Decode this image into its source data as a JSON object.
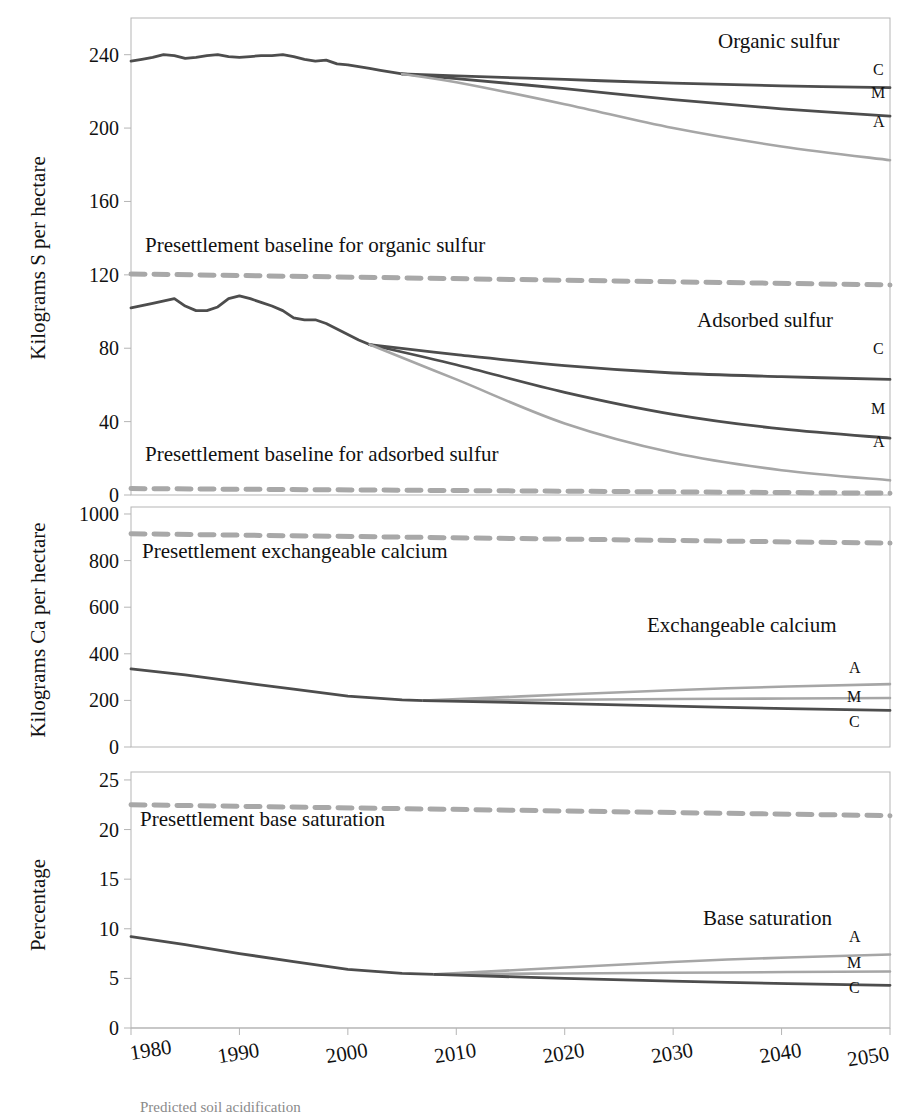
{
  "figure": {
    "caption_partial": "Predicted soil acidification"
  },
  "axes": {
    "x": {
      "label": "",
      "ticks": [
        1980,
        1990,
        2000,
        2010,
        2020,
        2030,
        2040,
        2050
      ],
      "min": 1980,
      "max": 2050
    }
  },
  "colors": {
    "scenario_c": "#555555",
    "scenario_m": "#666666",
    "scenario_a": "#a6a6a6",
    "historical": "#4d4d4d",
    "baseline_dashed": "#a8a8a8",
    "frame": "#b5b5b5",
    "text": "#111111"
  },
  "panels": [
    {
      "id": "sulfur",
      "ylabel": "Kilograms S per hectare",
      "yticks": [
        0,
        40,
        80,
        120,
        160,
        200,
        240
      ],
      "ymin": 0,
      "ymax": 260,
      "annotations": [
        {
          "name": "organic-sulfur-title",
          "text": "Organic sulfur"
        },
        {
          "name": "adsorbed-sulfur-title",
          "text": "Adsorbed sulfur"
        },
        {
          "name": "organic-baseline-label",
          "text": "Presettlement baseline for organic sulfur"
        },
        {
          "name": "adsorbed-baseline-label",
          "text": "Presettlement baseline for adsorbed sulfur"
        }
      ],
      "series_labels": [
        "C",
        "M",
        "A"
      ]
    },
    {
      "id": "calcium",
      "ylabel": "Kilograms Ca per hectare",
      "yticks": [
        0,
        200,
        400,
        600,
        800,
        1000
      ],
      "ymin": 0,
      "ymax": 1030,
      "annotations": [
        {
          "name": "exchangeable-calcium-title",
          "text": "Exchangeable calcium"
        },
        {
          "name": "calcium-baseline-label",
          "text": "Presettlement exchangeable calcium"
        }
      ],
      "series_labels": [
        "A",
        "M",
        "C"
      ]
    },
    {
      "id": "base-saturation",
      "ylabel": "Percentage",
      "yticks": [
        0,
        5,
        10,
        15,
        20,
        25
      ],
      "ymin": 0,
      "ymax": 25.8,
      "annotations": [
        {
          "name": "base-saturation-title",
          "text": "Base saturation"
        },
        {
          "name": "base-saturation-baseline-label",
          "text": "Presettlement base saturation"
        }
      ],
      "series_labels": [
        "A",
        "M",
        "C"
      ]
    }
  ],
  "chart_data": [
    {
      "type": "line",
      "title": "Organic sulfur / Adsorbed sulfur",
      "xlabel": "",
      "ylabel": "Kilograms S per hectare",
      "xlim": [
        1980,
        2050
      ],
      "ylim": [
        0,
        260
      ],
      "grid": false,
      "legend": "inline end-of-line labels (C, M, A)",
      "annotations": [
        "Organic sulfur",
        "Adsorbed sulfur",
        "Presettlement baseline for organic sulfur",
        "Presettlement baseline for adsorbed sulfur"
      ],
      "series": [
        {
          "name": "Organic sulfur historical",
          "style": "solid-dark",
          "x": [
            1980,
            1981,
            1982,
            1983,
            1984,
            1985,
            1986,
            1987,
            1988,
            1989,
            1990,
            1991,
            1992,
            1993,
            1994,
            1995,
            1996,
            1997,
            1998,
            1999,
            2000,
            2001,
            2002,
            2003,
            2004,
            2005
          ],
          "values": [
            236.5,
            237.5,
            238.5,
            240.0,
            239.5,
            238.0,
            238.5,
            239.5,
            240.0,
            239.0,
            238.5,
            239.0,
            239.5,
            239.5,
            240.0,
            239.0,
            237.5,
            236.5,
            237.0,
            235.0,
            234.5,
            233.5,
            232.5,
            231.5,
            230.5,
            229.5
          ]
        },
        {
          "name": "Organic sulfur C",
          "style": "solid-dark",
          "x": [
            2005,
            2010,
            2020,
            2030,
            2040,
            2050
          ],
          "values": [
            229.5,
            228.5,
            226.5,
            224.5,
            223.0,
            222.0
          ]
        },
        {
          "name": "Organic sulfur M",
          "style": "solid-dark",
          "x": [
            2005,
            2010,
            2020,
            2030,
            2040,
            2050
          ],
          "values": [
            229.5,
            227.0,
            221.5,
            215.5,
            210.5,
            206.5
          ]
        },
        {
          "name": "Organic sulfur A",
          "style": "solid-light",
          "x": [
            2005,
            2010,
            2020,
            2030,
            2040,
            2050
          ],
          "values": [
            229.5,
            225.0,
            213.0,
            200.0,
            190.0,
            182.5
          ]
        },
        {
          "name": "Presettlement baseline for organic sulfur",
          "style": "dashed",
          "x": [
            1980,
            2050
          ],
          "values": [
            120.5,
            114.5
          ]
        },
        {
          "name": "Adsorbed sulfur historical",
          "style": "solid-dark",
          "x": [
            1980,
            1982,
            1984,
            1985,
            1986,
            1987,
            1988,
            1989,
            1990,
            1991,
            1992,
            1993,
            1994,
            1995,
            1996,
            1997,
            1998,
            1999,
            2000,
            2001,
            2002
          ],
          "values": [
            102.0,
            104.5,
            107.0,
            103.0,
            100.5,
            100.5,
            102.5,
            107.0,
            108.5,
            107.0,
            105.0,
            103.0,
            100.5,
            96.5,
            95.5,
            95.5,
            93.5,
            90.5,
            87.5,
            84.5,
            82.0
          ]
        },
        {
          "name": "Adsorbed sulfur C",
          "style": "solid-dark",
          "x": [
            2002,
            2010,
            2020,
            2030,
            2040,
            2050
          ],
          "values": [
            82.0,
            76.5,
            70.5,
            66.5,
            64.5,
            63.0
          ]
        },
        {
          "name": "Adsorbed sulfur M",
          "style": "solid-dark",
          "x": [
            2002,
            2010,
            2020,
            2030,
            2040,
            2050
          ],
          "values": [
            82.0,
            71.0,
            56.0,
            44.0,
            36.0,
            31.0
          ]
        },
        {
          "name": "Adsorbed sulfur A",
          "style": "solid-light",
          "x": [
            2002,
            2010,
            2020,
            2030,
            2040,
            2050
          ],
          "values": [
            82.0,
            63.0,
            39.0,
            23.0,
            13.5,
            8.0
          ]
        },
        {
          "name": "Presettlement baseline for adsorbed sulfur",
          "style": "dashed",
          "x": [
            1980,
            2050
          ],
          "values": [
            3.5,
            1.0
          ]
        }
      ]
    },
    {
      "type": "line",
      "title": "Exchangeable calcium",
      "xlabel": "",
      "ylabel": "Kilograms Ca per hectare",
      "xlim": [
        1980,
        2050
      ],
      "ylim": [
        0,
        1030
      ],
      "grid": false,
      "legend": "inline end-of-line labels (A, M, C)",
      "annotations": [
        "Exchangeable calcium",
        "Presettlement exchangeable calcium"
      ],
      "series": [
        {
          "name": "Exchangeable calcium historical",
          "style": "solid-dark",
          "x": [
            1980,
            1985,
            1990,
            1995,
            2000,
            2005,
            2007
          ],
          "values": [
            335,
            310,
            278,
            248,
            218,
            202,
            199
          ]
        },
        {
          "name": "Exchangeable calcium A",
          "style": "solid-light",
          "x": [
            2007,
            2020,
            2035,
            2050
          ],
          "values": [
            199,
            225,
            252,
            270
          ]
        },
        {
          "name": "Exchangeable calcium M",
          "style": "solid-light",
          "x": [
            2007,
            2020,
            2035,
            2050
          ],
          "values": [
            199,
            203,
            207,
            210
          ]
        },
        {
          "name": "Exchangeable calcium C",
          "style": "solid-dark",
          "x": [
            2007,
            2020,
            2035,
            2050
          ],
          "values": [
            199,
            186,
            170,
            157
          ]
        },
        {
          "name": "Presettlement exchangeable calcium",
          "style": "dashed",
          "x": [
            1980,
            2050
          ],
          "values": [
            915,
            875
          ]
        }
      ]
    },
    {
      "type": "line",
      "title": "Base saturation",
      "xlabel": "",
      "ylabel": "Percentage",
      "xlim": [
        1980,
        2050
      ],
      "ylim": [
        0,
        25.8
      ],
      "grid": false,
      "legend": "inline end-of-line labels (A, M, C)",
      "annotations": [
        "Base saturation",
        "Presettlement base saturation"
      ],
      "series": [
        {
          "name": "Base saturation historical",
          "style": "solid-dark",
          "x": [
            1980,
            1985,
            1990,
            1995,
            2000,
            2005,
            2008
          ],
          "values": [
            9.2,
            8.4,
            7.5,
            6.7,
            5.9,
            5.5,
            5.4
          ]
        },
        {
          "name": "Base saturation A",
          "style": "solid-light",
          "x": [
            2008,
            2020,
            2035,
            2050
          ],
          "values": [
            5.4,
            6.1,
            6.9,
            7.4
          ]
        },
        {
          "name": "Base saturation M",
          "style": "solid-light",
          "x": [
            2008,
            2020,
            2035,
            2050
          ],
          "values": [
            5.4,
            5.5,
            5.6,
            5.7
          ]
        },
        {
          "name": "Base saturation C",
          "style": "solid-dark",
          "x": [
            2008,
            2020,
            2035,
            2050
          ],
          "values": [
            5.4,
            5.0,
            4.6,
            4.3
          ]
        },
        {
          "name": "Presettlement base saturation",
          "style": "dashed",
          "x": [
            1980,
            2050
          ],
          "values": [
            22.5,
            21.4
          ]
        }
      ]
    }
  ]
}
